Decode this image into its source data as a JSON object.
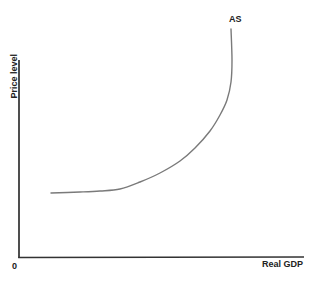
{
  "chart_data": {
    "type": "line",
    "title": "",
    "xlabel": "Real GDP",
    "ylabel": "Price level",
    "origin_label": "0",
    "legend": [],
    "grid": false,
    "series": [
      {
        "name": "AS",
        "label": "AS",
        "description": "Aggregate supply curve: horizontal at low output, upward sloping in the middle, vertical near full capacity",
        "points_px": [
          [
            51,
            193
          ],
          [
            80,
            192
          ],
          [
            100,
            191
          ],
          [
            120,
            189
          ],
          [
            140,
            182
          ],
          [
            160,
            173
          ],
          [
            180,
            161
          ],
          [
            195,
            148
          ],
          [
            210,
            131
          ],
          [
            220,
            115
          ],
          [
            227,
            100
          ],
          [
            231,
            82
          ],
          [
            232,
            60
          ],
          [
            231,
            29
          ]
        ]
      }
    ],
    "axes": {
      "x": {
        "label": "Real GDP",
        "ticks": [],
        "origin": "0"
      },
      "y": {
        "label": "Price level",
        "ticks": []
      }
    },
    "colors": {
      "axis": "#222222",
      "curve": "#7a7a7a",
      "text": "#222222"
    }
  },
  "labels": {
    "x_axis": "Real GDP",
    "y_axis": "Price level",
    "origin": "0",
    "curve": "AS"
  }
}
